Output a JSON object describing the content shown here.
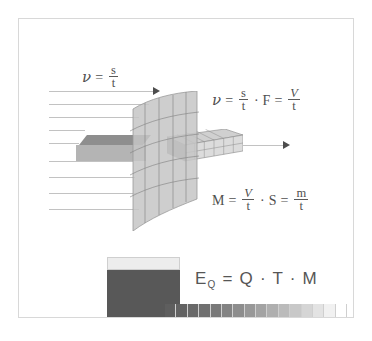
{
  "figure": {
    "title_present": false,
    "border_color": "#d8d8d8",
    "background": "#ffffff"
  },
  "equations": {
    "velocity_simple": {
      "lhs": "ν",
      "eq": "=",
      "numerator": "s",
      "denominator": "t"
    },
    "flow_rate": {
      "lhs": "ν",
      "eq1": "=",
      "num1": "s",
      "den1": "t",
      "dot1": "·",
      "factor": "F",
      "eq2": "=",
      "num2": "V",
      "den2": "t"
    },
    "mass_flow": {
      "lhs": "M",
      "eq1": "=",
      "num1": "V",
      "den1": "t",
      "dot1": "·",
      "factor": "S",
      "eq2": "=",
      "num2": "m",
      "den2": "t"
    },
    "heat_energy": {
      "lhs": "E",
      "subscript": "Q",
      "eq": "=",
      "term1": "Q",
      "dot1": "·",
      "term2": "T",
      "dot2": "·",
      "term3": "M"
    }
  },
  "diagram": {
    "flow_lines_count": 8,
    "flow_arrow_inlet": "arrow-right-icon",
    "flow_arrow_outlet": "arrow-right-icon",
    "plane": {
      "name": "cross-section-plane",
      "fill": "#c8c8c8",
      "grid_lines": 9
    },
    "beam_left": {
      "top_face_color": "#8e8e8e",
      "front_face_color": "#b4b4b4"
    },
    "beam_right": {
      "name": "wireframe-volume-box",
      "cells_across": 6,
      "cells_down": 2,
      "fill": "#d9d9d9"
    }
  },
  "energy_block": {
    "cap_color": "#ededed",
    "body_color": "#585858",
    "gradient_bar": {
      "segments": 16,
      "from_color": "#5e5e5e",
      "to_color": "#ffffff"
    }
  }
}
